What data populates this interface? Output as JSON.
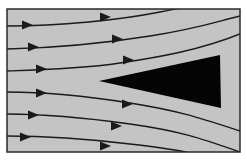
{
  "diagram": {
    "title": "",
    "colors": {
      "page_background": "#ffffff",
      "field_background": "#c4c4c4",
      "frame": "#2a2a2a",
      "streamline": "#1a1a1a",
      "obstacle": "#050505"
    },
    "frame": {
      "x": 7,
      "y": 9,
      "width": 233,
      "height": 143
    },
    "obstacle": {
      "shape": "triangle",
      "points": [
        [
          99,
          81
        ],
        [
          220,
          55
        ],
        [
          221,
          108
        ]
      ]
    },
    "streamlines": [
      {
        "path": "M7 26 C 60 26, 120 20, 160 12 S 200 4, 240 -2",
        "arrows": [
          [
            27,
            25
          ],
          [
            105,
            17
          ]
        ]
      },
      {
        "path": "M7 49 C 50 48, 100 44, 150 36 S 215 22, 240 16",
        "arrows": [
          [
            33,
            47
          ],
          [
            117,
            39
          ]
        ]
      },
      {
        "path": "M7 71 C 40 70, 80 69, 120 63 S 200 50, 240 34",
        "arrows": [
          [
            41,
            69
          ],
          [
            128,
            60
          ]
        ]
      },
      {
        "path": "M7 92 C 40 92, 80 95, 130 103 S 200 118, 240 131",
        "arrows": [
          [
            41,
            93
          ],
          [
            127,
            104
          ]
        ]
      },
      {
        "path": "M7 114 C 40 114, 80 117, 130 124 S 200 138, 240 152",
        "arrows": [
          [
            33,
            115
          ],
          [
            116,
            126
          ]
        ]
      },
      {
        "path": "M7 136 C 40 136, 80 138, 130 144 S 190 152, 215 160",
        "arrows": [
          [
            25,
            137
          ],
          [
            105,
            146
          ]
        ]
      }
    ]
  }
}
